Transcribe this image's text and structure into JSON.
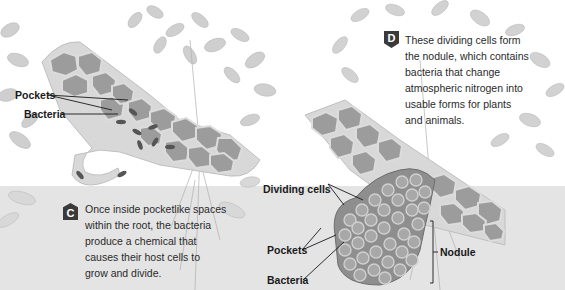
{
  "diagram": {
    "topic": "Root nodule formation",
    "colors": {
      "background": "#ffffff",
      "soil": "#e4e4e4",
      "cell_fill": "#9a9a9a",
      "cell_wall": "#d6d6d6",
      "foliage": "#c8c8c8",
      "badge": "#3a3a3a",
      "text": "#1a1a1a"
    },
    "step_c": {
      "badge": "C",
      "caption_lines": [
        "Once inside pocketlike spaces",
        "within the root, the bacteria",
        "produce a chemical that",
        "causes their host cells to",
        "grow and divide."
      ]
    },
    "step_d": {
      "badge": "D",
      "caption_lines": [
        "These dividing cells form",
        "the nodule, which contains",
        "bacteria that change",
        "atmospheric nitrogen into",
        "usable forms for plants",
        "and animals."
      ]
    },
    "left_labels": {
      "pockets": "Pockets",
      "bacteria": "Bacteria"
    },
    "right_labels": {
      "dividing_cells": "Dividing cells",
      "pockets": "Pockets",
      "bacteria": "Bacteria",
      "nodule": "Nodule"
    }
  }
}
